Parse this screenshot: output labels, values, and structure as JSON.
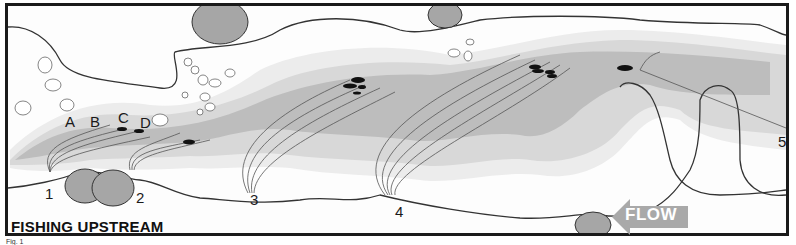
{
  "figure": {
    "title": "FISHING UPSTREAM",
    "caption": "Fig. 1",
    "flow_label": "FLOW",
    "flow_direction": "left",
    "cast_positions": [
      "1",
      "2",
      "3",
      "4",
      "5"
    ],
    "fish_lanes": [
      "A",
      "B",
      "C",
      "D"
    ]
  },
  "colors": {
    "frame": "#1a1a1a",
    "bank_line": "#333333",
    "rock": "#a6a6a6",
    "shallow": "#ececec",
    "mid": "#d6d6d6",
    "deep": "#bdbdbd",
    "fish": "#111111",
    "flow_arrow": "#a9a9a9",
    "line": "#555555"
  }
}
